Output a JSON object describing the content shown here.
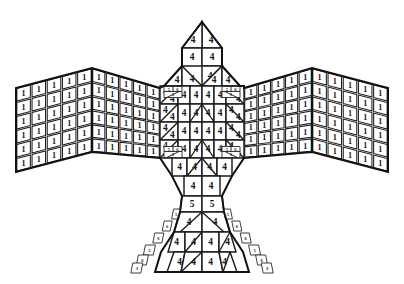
{
  "figure": {
    "background_color": "#ffffff",
    "line_color": "#1c1c1c",
    "outline_color": "#121212",
    "label_color": "#151515",
    "canvas": {
      "width": 404,
      "height": 284
    }
  },
  "legend": {
    "region_codes": {
      "wing": "1",
      "body": "4",
      "head": "4",
      "tail_upper": "5",
      "tail_edge_a": "5",
      "tail_edge_b": "6",
      "tail_edge_c": "3",
      "shoulder_joint": "5"
    }
  },
  "regions": {
    "left_wing": {
      "name": "left-wing",
      "label_value": "1",
      "outer_panel": {
        "cols": 5,
        "rows": 6
      },
      "inner_panel": {
        "cols": 5,
        "rows": 6
      }
    },
    "right_wing": {
      "name": "right-wing",
      "label_value": "1",
      "outer_panel": {
        "cols": 5,
        "rows": 6
      },
      "inner_panel": {
        "cols": 5,
        "rows": 6
      }
    },
    "head": {
      "name": "head",
      "label_value": "4",
      "rows": [
        {
          "cells": [
            "4",
            "4"
          ]
        },
        {
          "cells": [
            "4",
            "4"
          ]
        }
      ]
    },
    "body": {
      "name": "body",
      "label_value": "4",
      "rows": [
        {
          "cells": [
            "4",
            "4",
            "4",
            "4"
          ]
        },
        {
          "cells": [
            "4",
            "4",
            "4",
            "4",
            "4",
            "4"
          ]
        },
        {
          "cells": [
            "4",
            "4",
            "4",
            "4",
            "4",
            "4"
          ]
        },
        {
          "cells": [
            "4",
            "4",
            "4",
            "4",
            "4",
            "4"
          ]
        },
        {
          "cells": [
            "4",
            "4",
            "4",
            "4",
            "4",
            "4"
          ]
        },
        {
          "cells": [
            "4",
            "4",
            "4",
            "4"
          ]
        },
        {
          "cells": [
            "4",
            "4"
          ]
        }
      ]
    },
    "tail": {
      "name": "tail",
      "label_value": "4",
      "rows": [
        {
          "cells": [
            "5",
            "5"
          ]
        },
        {
          "cells": [
            "4",
            "4"
          ]
        },
        {
          "cells": [
            "4",
            "4",
            "4",
            "4"
          ]
        },
        {
          "cells": [
            "4",
            "4",
            "4",
            "4"
          ]
        }
      ],
      "edge_cells": [
        "5",
        "6",
        "6",
        "5",
        "6",
        "3"
      ]
    },
    "shoulder_joints": {
      "name": "shoulder-joints",
      "count": 4,
      "labels": [
        "5",
        "6",
        "3"
      ]
    }
  },
  "chart_data": {
    "type": "diagram",
    "region_codes": [
      {
        "region": "wings",
        "code": "1",
        "approx_cell_count": 120
      },
      {
        "region": "head",
        "code": "4",
        "approx_cell_count": 6
      },
      {
        "region": "body",
        "code": "4",
        "approx_cell_count": 40
      },
      {
        "region": "tail",
        "code": "4",
        "approx_cell_count": 12
      },
      {
        "region": "tail upper band",
        "code": "5",
        "approx_cell_count": 2
      },
      {
        "region": "tail edges",
        "code": "6",
        "approx_cell_count": 8
      },
      {
        "region": "tail edge tips",
        "code": "3",
        "approx_cell_count": 2
      },
      {
        "region": "shoulder joints",
        "code": "5",
        "approx_cell_count": 4
      }
    ]
  }
}
